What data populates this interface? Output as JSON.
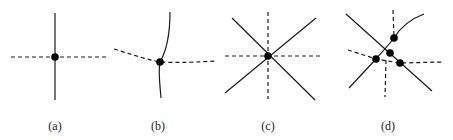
{
  "figure": {
    "panels": [
      {
        "id": "a",
        "label": "(a)",
        "label_x": 55,
        "description": "Single solid vertical line crossing a straight dashed horizontal line at one vertex"
      },
      {
        "id": "b",
        "label": "(b)",
        "label_x": 158,
        "description": "Curved solid line crossing a bent dashed line at one vertex"
      },
      {
        "id": "c",
        "label": "(c)",
        "label_x": 268,
        "description": "Two solid diagonals and two dashed axis lines meeting at a single vertex"
      },
      {
        "id": "d",
        "label": "(d)",
        "label_x": 388,
        "description": "Lines crossing at multiple nearby vertices (four intersection points)"
      }
    ],
    "colors": {
      "line": "#1a1a1a",
      "vertex": "#000000",
      "background": "#ffffff"
    }
  }
}
